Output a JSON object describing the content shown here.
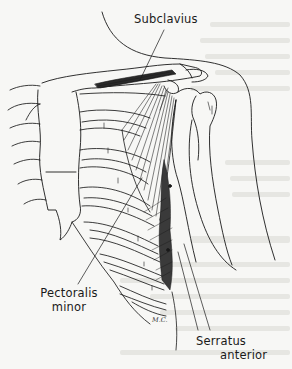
{
  "figure": {
    "type": "anatomical-line-illustration",
    "labels": {
      "subclavius": "Subclavius",
      "pectoralis_minor_line1": "Pectoralis",
      "pectoralis_minor_line2": "minor",
      "serratus_anterior_line1": "Serratus",
      "serratus_anterior_line2": "anterior"
    },
    "signature": "M.C."
  },
  "colors": {
    "ink": "#1a1a1a",
    "paper": "#f7f7f5",
    "bleed_through": "#e6e6e2"
  }
}
